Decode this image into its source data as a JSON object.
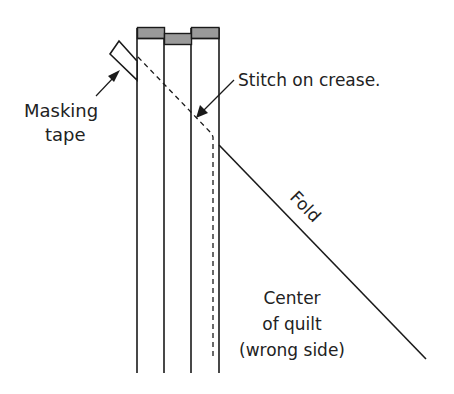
{
  "diagram": {
    "labels": {
      "masking_tape_line1": "Masking",
      "masking_tape_line2": "tape",
      "stitch": "Stitch on crease.",
      "fold": "Fold",
      "center_line1": "Center",
      "center_line2": "of quilt",
      "center_line3": "(wrong side)"
    },
    "colors": {
      "line": "#1a1a1a",
      "strip_cap": "#9a9a9a",
      "background": "#ffffff"
    }
  }
}
